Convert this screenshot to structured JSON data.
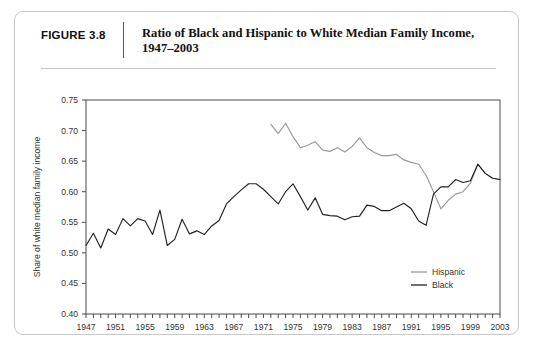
{
  "figure": {
    "number_label": "FIGURE 3.8",
    "title": "Ratio of Black and Hispanic to White Median Family Income, 1947–2003"
  },
  "colors": {
    "hispanic": "#9a9a9a",
    "black": "#222222",
    "axis": "#4a4a4a",
    "border": "#c8c8c8"
  },
  "chart_data": {
    "type": "line",
    "title": "Ratio of Black and Hispanic to White Median Family Income, 1947–2003",
    "xlabel": "",
    "ylabel": "Share of white median family income",
    "xlim": [
      1947,
      2003
    ],
    "ylim": [
      0.4,
      0.75
    ],
    "ytick_labels": [
      "0.40",
      "0.45",
      "0.50",
      "0.55",
      "0.60",
      "0.65",
      "0.70",
      "0.75"
    ],
    "ytick_values": [
      0.4,
      0.45,
      0.5,
      0.55,
      0.6,
      0.65,
      0.7,
      0.75
    ],
    "xtick_labels": [
      "1947",
      "1951",
      "1955",
      "1959",
      "1963",
      "1967",
      "1971",
      "1975",
      "1979",
      "1983",
      "1987",
      "1991",
      "1995",
      "1999",
      "2003"
    ],
    "xtick_values": [
      1947,
      1951,
      1955,
      1959,
      1963,
      1967,
      1971,
      1975,
      1979,
      1983,
      1987,
      1991,
      1995,
      1999,
      2003
    ],
    "minor_tick_step": 1,
    "grid": false,
    "legend_position": "lower-right",
    "series": [
      {
        "name": "Hispanic",
        "color": "#9a9a9a",
        "x": [
          1972,
          1973,
          1974,
          1975,
          1976,
          1977,
          1978,
          1979,
          1980,
          1981,
          1982,
          1983,
          1984,
          1985,
          1986,
          1987,
          1988,
          1989,
          1990,
          1991,
          1992,
          1993,
          1994,
          1995,
          1996,
          1997,
          1998,
          1999,
          2000,
          2001,
          2002,
          2003
        ],
        "values": [
          0.71,
          0.695,
          0.712,
          0.69,
          0.672,
          0.676,
          0.682,
          0.668,
          0.666,
          0.672,
          0.665,
          0.674,
          0.688,
          0.672,
          0.664,
          0.659,
          0.659,
          0.661,
          0.652,
          0.648,
          0.645,
          0.627,
          0.6,
          0.572,
          0.586,
          0.596,
          0.6,
          0.614,
          0.645,
          0.63,
          0.622,
          0.62
        ]
      },
      {
        "name": "Black",
        "color": "#222222",
        "x": [
          1947,
          1948,
          1949,
          1950,
          1951,
          1952,
          1953,
          1954,
          1955,
          1956,
          1957,
          1958,
          1959,
          1960,
          1961,
          1962,
          1963,
          1964,
          1965,
          1966,
          1967,
          1968,
          1969,
          1970,
          1971,
          1972,
          1973,
          1974,
          1975,
          1976,
          1977,
          1978,
          1979,
          1980,
          1981,
          1982,
          1983,
          1984,
          1985,
          1986,
          1987,
          1988,
          1989,
          1990,
          1991,
          1992,
          1993,
          1994,
          1995,
          1996,
          1997,
          1998,
          1999,
          2000,
          2001,
          2002,
          2003
        ],
        "values": [
          0.512,
          0.532,
          0.508,
          0.539,
          0.53,
          0.556,
          0.544,
          0.556,
          0.552,
          0.53,
          0.57,
          0.512,
          0.522,
          0.555,
          0.531,
          0.536,
          0.53,
          0.544,
          0.553,
          0.58,
          0.592,
          0.603,
          0.613,
          0.613,
          0.604,
          0.592,
          0.58,
          0.6,
          0.613,
          0.592,
          0.57,
          0.59,
          0.563,
          0.561,
          0.56,
          0.554,
          0.559,
          0.56,
          0.578,
          0.576,
          0.569,
          0.569,
          0.575,
          0.581,
          0.572,
          0.552,
          0.545,
          0.596,
          0.608,
          0.608,
          0.62,
          0.615,
          0.618,
          0.645,
          0.63,
          0.622,
          0.62
        ]
      }
    ]
  },
  "legend": {
    "items": [
      {
        "label": "Hispanic",
        "color": "#9a9a9a"
      },
      {
        "label": "Black",
        "color": "#222222"
      }
    ]
  }
}
